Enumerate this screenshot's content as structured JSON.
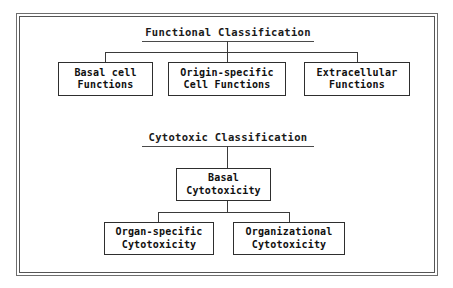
{
  "diagram": {
    "type": "hierarchy-tree",
    "background_color": "#ffffff",
    "frame_color": "#6e6e6e",
    "box_border_color": "#2e2e2e",
    "text_color": "#101010",
    "sections": [
      {
        "id": "functional",
        "title": "Functional Classification",
        "children": [
          {
            "id": "basal-cell-functions",
            "line1": "Basal cell",
            "line2": "Functions"
          },
          {
            "id": "origin-specific-cell-functions",
            "line1": "Origin-specific",
            "line2": "Cell Functions"
          },
          {
            "id": "extracellular-functions",
            "line1": "Extracellular",
            "line2": "Functions"
          }
        ]
      },
      {
        "id": "cytotoxic",
        "title": "Cytotoxic Classification",
        "root": {
          "id": "basal-cytotoxicity",
          "line1": "Basal",
          "line2": "Cytotoxicity"
        },
        "children": [
          {
            "id": "organ-specific-cytotoxicity",
            "line1": "Organ-specific",
            "line2": "Cytotoxicity"
          },
          {
            "id": "organizational-cytotoxicity",
            "line1": "Organizational",
            "line2": "Cytotoxicity"
          }
        ]
      }
    ]
  }
}
